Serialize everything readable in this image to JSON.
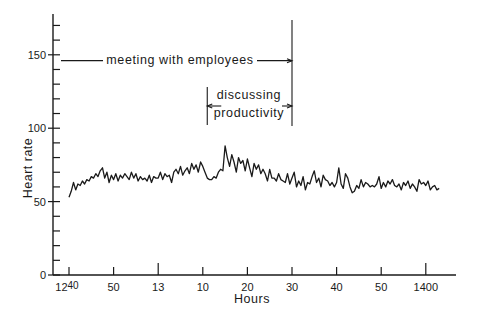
{
  "chart_data": {
    "type": "line",
    "title": "",
    "xlabel": "Hours",
    "ylabel": "Heart rate",
    "ylim": [
      0,
      175
    ],
    "xlim_minutes": [
      -3,
      87
    ],
    "grid": false,
    "legend": null,
    "y_ticks": [
      {
        "value": 0,
        "label": "0"
      },
      {
        "value": 50,
        "label": "50"
      },
      {
        "value": 100,
        "label": "100"
      },
      {
        "value": 150,
        "label": "150"
      }
    ],
    "y_minor_tick_step": 10,
    "x_ticks": [
      {
        "minute": 0,
        "label": "1240",
        "major": false
      },
      {
        "minute": 10,
        "label": "50",
        "major": false
      },
      {
        "minute": 20,
        "label": "13",
        "major": true
      },
      {
        "minute": 30,
        "label": "10",
        "major": false
      },
      {
        "minute": 40,
        "label": "20",
        "major": false
      },
      {
        "minute": 50,
        "label": "30",
        "major": false
      },
      {
        "minute": 60,
        "label": "40",
        "major": false
      },
      {
        "minute": 70,
        "label": "50",
        "major": false
      },
      {
        "minute": 80,
        "label": "1400",
        "major": true
      }
    ],
    "annotations": [
      {
        "label": "meeting with employees",
        "from_minute": -3,
        "to_minute": 50,
        "y_value": 146
      },
      {
        "label_line1": "discussing",
        "label_line2": "productivity",
        "from_minute": 31,
        "to_minute": 50,
        "y_value": 115
      }
    ],
    "series": [
      {
        "name": "Heart rate",
        "x_minutes": [
          0,
          0.5,
          1,
          1.5,
          2,
          2.5,
          3,
          3.5,
          4,
          4.5,
          5,
          5.5,
          6,
          6.5,
          7,
          7.5,
          8,
          8.5,
          9,
          9.5,
          10,
          10.5,
          11,
          11.5,
          12,
          12.5,
          13,
          13.5,
          14,
          14.5,
          15,
          15.5,
          16,
          16.5,
          17,
          17.5,
          18,
          18.5,
          19,
          19.5,
          20,
          20.5,
          21,
          21.5,
          22,
          22.5,
          23,
          23.5,
          24,
          24.5,
          25,
          25.5,
          26,
          26.5,
          27,
          27.5,
          28,
          28.5,
          29,
          29.5,
          30,
          30.5,
          31,
          31.5,
          32,
          32.5,
          33,
          33.5,
          34,
          34.5,
          35,
          35.5,
          36,
          36.5,
          37,
          37.5,
          38,
          38.5,
          39,
          39.5,
          40,
          40.5,
          41,
          41.5,
          42,
          42.5,
          43,
          43.5,
          44,
          44.5,
          45,
          45.5,
          46,
          46.5,
          47,
          47.5,
          48,
          48.5,
          49,
          49.5,
          50,
          50.5,
          51,
          51.5,
          52,
          52.5,
          53,
          53.5,
          54,
          54.5,
          55,
          55.5,
          56,
          56.5,
          57,
          57.5,
          58,
          58.5,
          59,
          59.5,
          60,
          60.5,
          61,
          61.5,
          62,
          62.5,
          63,
          63.5,
          64,
          64.5,
          65,
          65.5,
          66,
          66.5,
          67,
          67.5,
          68,
          68.5,
          69,
          69.5,
          70,
          70.5,
          71,
          71.5,
          72,
          72.5,
          73,
          73.5,
          74,
          74.5,
          75,
          75.5,
          76,
          76.5,
          77,
          77.5,
          78,
          78.5,
          79,
          79.5,
          80,
          80.5,
          81,
          81.5,
          82,
          82.5,
          83,
          83.5,
          84,
          84.5,
          85,
          85.5,
          86,
          86.5
        ],
        "values": [
          53,
          57,
          63,
          58,
          62,
          61,
          64,
          62,
          65,
          64,
          67,
          66,
          69,
          67,
          71,
          73,
          66,
          70,
          63,
          68,
          65,
          69,
          64,
          68,
          66,
          69,
          67,
          65,
          70,
          66,
          69,
          64,
          67,
          65,
          66,
          64,
          68,
          63,
          67,
          66,
          66,
          70,
          65,
          69,
          67,
          68,
          63,
          70,
          72,
          69,
          74,
          68,
          71,
          73,
          69,
          76,
          72,
          75,
          70,
          77,
          74,
          70,
          66,
          65,
          65,
          67,
          66,
          70,
          72,
          71,
          88,
          80,
          74,
          82,
          77,
          70,
          80,
          76,
          78,
          71,
          79,
          73,
          67,
          76,
          72,
          75,
          69,
          72,
          69,
          64,
          72,
          66,
          66,
          64,
          69,
          65,
          64,
          63,
          69,
          62,
          66,
          70,
          60,
          64,
          61,
          67,
          58,
          63,
          62,
          67,
          71,
          63,
          66,
          60,
          68,
          65,
          64,
          61,
          63,
          60,
          63,
          73,
          62,
          59,
          69,
          66,
          60,
          56,
          57,
          61,
          59,
          65,
          60,
          63,
          62,
          60,
          61,
          60,
          62,
          67,
          59,
          63,
          60,
          64,
          62,
          65,
          61,
          60,
          62,
          58,
          63,
          61,
          64,
          59,
          62,
          60,
          57,
          65,
          62,
          63,
          61,
          64,
          58,
          60,
          61,
          58,
          59
        ]
      }
    ]
  },
  "axes": {
    "ylabel": "Heart rate",
    "xlabel": "Hours"
  },
  "annotations": {
    "meeting": "meeting with employees",
    "discussing_line1": "discussing",
    "discussing_line2": "productivity"
  }
}
